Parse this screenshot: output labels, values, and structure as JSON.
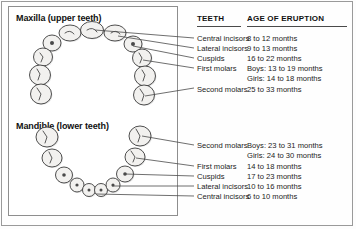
{
  "figure": {
    "diagram_title_upper": "Maxilla (upper teeth)",
    "diagram_title_lower": "Mandible (lower teeth)"
  },
  "table": {
    "headers": {
      "teeth": "TEETH",
      "age": "AGE OF ERUPTION"
    },
    "upper_rows": [
      {
        "tooth": "Central incisors",
        "age": "8 to 12 months",
        "age2": ""
      },
      {
        "tooth": "Lateral incisors",
        "age": "9 to 13 months",
        "age2": ""
      },
      {
        "tooth": "Cuspids",
        "age": "16 to 22 months",
        "age2": ""
      },
      {
        "tooth": "First molars",
        "age": "Boys: 13 to 19 months",
        "age2": "Girls: 14 to 18 months"
      },
      {
        "tooth": "Second molars",
        "age": "25 to 33 months",
        "age2": ""
      }
    ],
    "lower_rows": [
      {
        "tooth": "Second molars",
        "age": "Boys: 23 to 31 months",
        "age2": "Girls: 24 to 30 months"
      },
      {
        "tooth": "First molars",
        "age": "14 to 18 months",
        "age2": ""
      },
      {
        "tooth": "Cuspids",
        "age": "17 to 23 months",
        "age2": ""
      },
      {
        "tooth": "Lateral incisors",
        "age": "10 to 16 months",
        "age2": ""
      },
      {
        "tooth": "Central incisors",
        "age": "6 to 10 months",
        "age2": ""
      }
    ]
  },
  "colors": {
    "frame": "#9a9a9a",
    "rule": "#4a4a4a",
    "tooth_fill": "#f2f1ef",
    "tooth_outline": "#3b3b3b",
    "text": "#1c1c1c"
  }
}
